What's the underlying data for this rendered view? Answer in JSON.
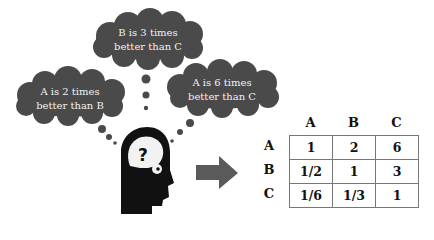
{
  "thoughts": [
    {
      "id": "top",
      "line1": "B is 3 times",
      "line2": "better than C"
    },
    {
      "id": "left",
      "line1": "A is 2 times",
      "line2": "better than B"
    },
    {
      "id": "right",
      "line1": "A is 6 times",
      "line2": "better than C"
    }
  ],
  "matrix": {
    "col_headers": [
      "A",
      "B",
      "C"
    ],
    "row_headers": [
      "A",
      "B",
      "C"
    ],
    "rows": [
      [
        "1",
        "2",
        "6"
      ],
      [
        "1/2",
        "1",
        "3"
      ],
      [
        "1/6",
        "1/3",
        "1"
      ]
    ]
  },
  "colors": {
    "cloud": "#4a4a4a",
    "head": "#111111",
    "arrow": "#5a5a5a",
    "grid": "#777777"
  }
}
